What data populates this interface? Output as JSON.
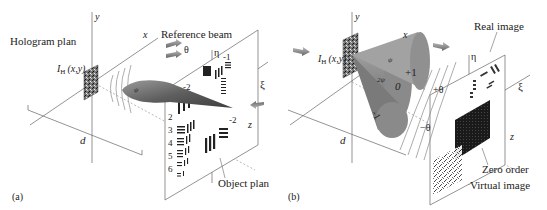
{
  "panel_a": {
    "tag": "(a)",
    "hologram_plan": "Hologram plan",
    "intensity_label": "I",
    "intensity_sub": "H",
    "intensity_args": "(x,y)",
    "axis_x": "x",
    "axis_y": "y",
    "axis_z": "z",
    "axis_xi": "ξ",
    "axis_eta": "η",
    "reference_beam": "Reference beam",
    "theta": "θ",
    "distance": "d",
    "object_plan": "Object plan",
    "chart_groups": [
      "-2",
      "-1",
      "1",
      "2",
      "3",
      "4",
      "5",
      "6",
      "-2",
      "1"
    ]
  },
  "panel_b": {
    "tag": "(b)",
    "intensity_label": "I",
    "intensity_sub": "H",
    "intensity_args": "(x,y)",
    "axis_x": "x",
    "axis_y": "y",
    "axis_z": "z",
    "axis_xi": "ξ",
    "axis_eta": "η",
    "order_plus": "+1",
    "order_zero": "0",
    "order_minus": "-1",
    "psi": "ψ",
    "two_psi": "2ψ",
    "plus_theta": "+θ",
    "minus_theta": "−θ",
    "distance": "d",
    "real_image": "Real image",
    "zero_order": "Zero order",
    "virtual_image": "Virtual image"
  },
  "colors": {
    "line": "#555555",
    "beam_dark": "#555555",
    "beam_light": "#b8b8b8",
    "arrow": "#888888"
  }
}
